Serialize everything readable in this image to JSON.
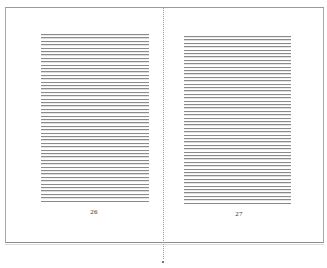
{
  "document": {
    "view": "two-page spread",
    "pages": [
      {
        "side": "left",
        "page_number": "26",
        "content": "ruled text block (placeholder lines)",
        "line_count": 50
      },
      {
        "side": "right",
        "page_number": "27",
        "content": "ruled text block (placeholder lines)",
        "line_count": 50
      }
    ]
  },
  "colors": {
    "background": "#ffffff",
    "rule_line": "#8a8a8a",
    "frame_border": "#9a9a9a",
    "page_number_text": "#333333"
  }
}
